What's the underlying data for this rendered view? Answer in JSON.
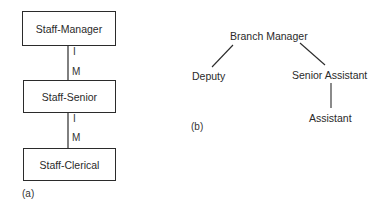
{
  "figure_a": {
    "caption": "(a)",
    "boxes": [
      {
        "label": "Staff-Manager"
      },
      {
        "label": "Staff-Senior"
      },
      {
        "label": "Staff-Clerical"
      }
    ],
    "links": [
      {
        "from": "Staff-Manager",
        "to": "Staff-Senior",
        "cardinality_top": "I",
        "cardinality_bottom": "M"
      },
      {
        "from": "Staff-Senior",
        "to": "Staff-Clerical",
        "cardinality_top": "I",
        "cardinality_bottom": "M"
      }
    ]
  },
  "figure_b": {
    "caption": "(b)",
    "nodes": [
      {
        "label": "Branch Manager"
      },
      {
        "label": "Deputy"
      },
      {
        "label": "Senior Assistant"
      },
      {
        "label": "Assistant"
      }
    ],
    "edges": [
      {
        "from": "Branch Manager",
        "to": "Deputy"
      },
      {
        "from": "Branch Manager",
        "to": "Senior Assistant"
      },
      {
        "from": "Senior Assistant",
        "to": "Assistant"
      }
    ]
  },
  "colors": {
    "line": "#2b2b2b",
    "text": "#2a2a2a",
    "background": "#ffffff"
  }
}
